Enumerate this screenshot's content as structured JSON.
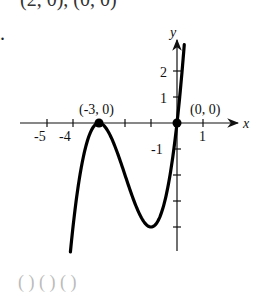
{
  "header_fragment": "(2, 0), (0, 0)",
  "bullet": ".",
  "footer_fragment": "(   )  (   )     (   )",
  "chart_data": {
    "type": "line",
    "title": "",
    "function": "f(x) = x(x+3)^2",
    "xlabel": "x",
    "ylabel": "y",
    "x_tick_labels": [
      "-5",
      "-4",
      "1"
    ],
    "y_tick_labels": [
      "2",
      "1",
      "-1"
    ],
    "x_ticks": [
      -5,
      -4,
      -3,
      -2,
      -1,
      1
    ],
    "y_ticks": [
      2,
      1,
      -1,
      -2,
      -3,
      -4
    ],
    "xlim": [
      -5.8,
      2.4
    ],
    "ylim": [
      -4.9,
      3.2
    ],
    "grid": false,
    "points": [
      {
        "label": "(-3, 0)",
        "x": -3,
        "y": 0
      },
      {
        "label": "(0, 0)",
        "x": 0,
        "y": 0
      }
    ],
    "curve_samples": {
      "x": [
        -4.1,
        -3.8,
        -3.5,
        -3.0,
        -2.5,
        -2.0,
        -1.5,
        -1.0,
        -0.5,
        0.0,
        0.28
      ],
      "y": [
        -4.96,
        -2.43,
        -0.88,
        0.0,
        -0.63,
        -2.0,
        -3.38,
        -4.0,
        -3.13,
        0.0,
        3.0
      ]
    }
  }
}
